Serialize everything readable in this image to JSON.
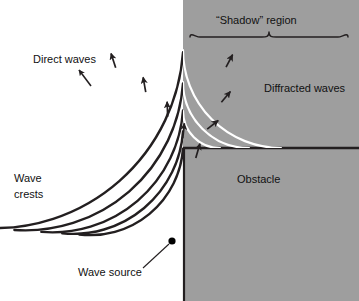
{
  "figure": {
    "title_region_label": "“Shadow” region",
    "labels": {
      "direct_waves": "Direct waves",
      "wave_crests_line1": "Wave",
      "wave_crests_line2": "crests",
      "wave_source": "Wave source",
      "diffracted_waves": "Diffracted waves",
      "obstacle": "Obstacle"
    },
    "colors": {
      "background": "#ffffff",
      "shadow_fill": "#9e9e9e",
      "obstacle_fill": "#9e9e9e",
      "crest_dark": "#231f20",
      "crest_light": "#ffffff",
      "text": "#1a1a1a",
      "source_dot": "#000000"
    },
    "geometry": {
      "source": {
        "x": 172,
        "y": 241
      },
      "shadow_corner": {
        "x": 183,
        "y": 148
      },
      "shade_left_x": 183,
      "obstacle_top_y": 148,
      "canvas": {
        "width": 359,
        "height": 301
      }
    },
    "direct_wave_radii": [
      93,
      110,
      131,
      158,
      189
    ],
    "diffracted_wave_radii": [
      37,
      66,
      98
    ],
    "brace": {
      "x1": 190,
      "x2": 348,
      "y": 31,
      "tip_x": 269
    },
    "direct_arrow_angles_deg": [
      118,
      108,
      100,
      92,
      84,
      74
    ],
    "diffracted_arrow_angles_deg": [
      62,
      50,
      38
    ]
  }
}
